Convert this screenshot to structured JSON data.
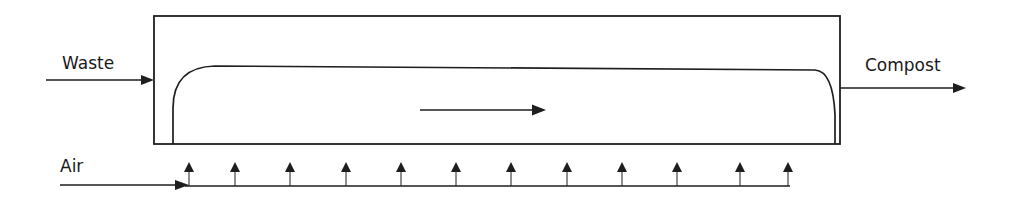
{
  "diagram": {
    "labels": {
      "input": "Waste",
      "output": "Compost",
      "aeration": "Air"
    },
    "air_nozzle_count": 12,
    "colors": {
      "line": "#1e1e1e",
      "background": "#ffffff"
    },
    "nodes": [
      {
        "id": "reactor",
        "type": "vessel"
      },
      {
        "id": "pile",
        "type": "material-bed"
      },
      {
        "id": "air-manifold",
        "type": "pipe"
      }
    ],
    "edges": [
      {
        "from": "Waste",
        "to": "reactor"
      },
      {
        "from": "reactor",
        "to": "Compost"
      },
      {
        "from": "Air",
        "to": "air-manifold"
      },
      {
        "from": "air-manifold",
        "to": "pile",
        "note": "12 upward air nozzles"
      }
    ],
    "flow_direction": "left-to-right"
  }
}
